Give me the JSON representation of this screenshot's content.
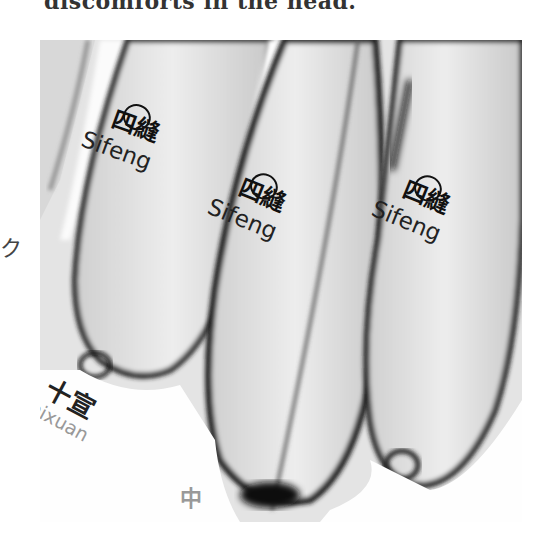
{
  "caption": {
    "text": "discomforts in the head."
  },
  "photo": {
    "subject": "fingertips with acupuncture point labels",
    "labels": [
      {
        "hanzi": "四縫",
        "pinyin": "Sifeng"
      },
      {
        "hanzi": "四縫",
        "pinyin": "Sifeng"
      },
      {
        "hanzi": "四縫",
        "pinyin": "Sifeng"
      }
    ],
    "bottom_label": {
      "hanzi": "十宣",
      "pinyin": "Shixuan"
    },
    "bottom_fragment": "中",
    "left_fragment": "ク"
  }
}
